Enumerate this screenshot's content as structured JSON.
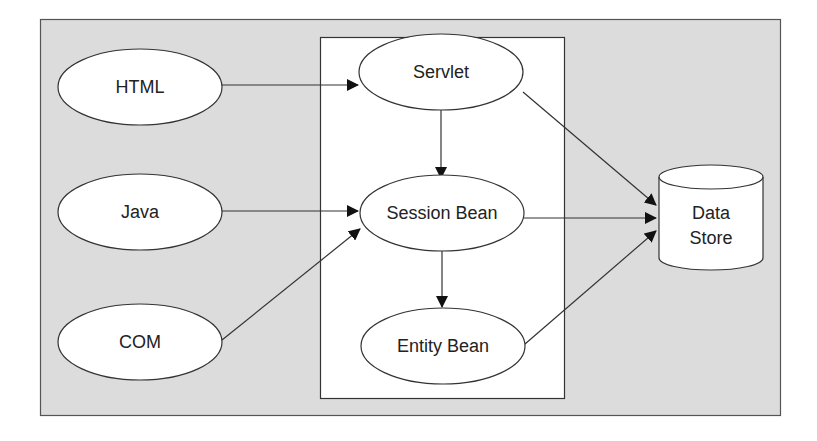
{
  "diagram": {
    "colors": {
      "outer_fill": "#dcdcdc",
      "inner_fill": "#ffffff",
      "stroke": "#333333"
    },
    "clients": [
      {
        "id": "html",
        "label": "HTML"
      },
      {
        "id": "java",
        "label": "Java"
      },
      {
        "id": "com",
        "label": "COM"
      }
    ],
    "server": [
      {
        "id": "servlet",
        "label": "Servlet"
      },
      {
        "id": "session-bean",
        "label": "Session Bean"
      },
      {
        "id": "entity-bean",
        "label": "Entity Bean"
      }
    ],
    "datastore": {
      "line1": "Data",
      "line2": "Store"
    },
    "edges": [
      {
        "from": "HTML",
        "to": "Servlet"
      },
      {
        "from": "Java",
        "to": "Session Bean"
      },
      {
        "from": "COM",
        "to": "Session Bean"
      },
      {
        "from": "Servlet",
        "to": "Session Bean"
      },
      {
        "from": "Session Bean",
        "to": "Entity Bean"
      },
      {
        "from": "Servlet",
        "to": "Data Store"
      },
      {
        "from": "Session Bean",
        "to": "Data Store"
      },
      {
        "from": "Entity Bean",
        "to": "Data Store"
      }
    ]
  }
}
